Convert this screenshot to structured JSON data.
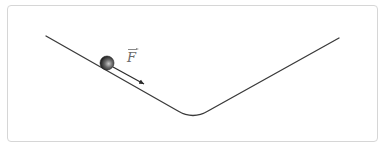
{
  "diagram": {
    "title": "",
    "force_label": "F",
    "force_is_vector": true,
    "colors": {
      "border": "#d6d6d6",
      "track": "#3a3a3a",
      "ball_dark": "#1e1e1e",
      "ball_light": "#bdbdbd",
      "arrow": "#2a2a2a",
      "label": "#6a6a6a"
    },
    "elements": [
      {
        "type": "track",
        "shape": "V-shaped incline with rounded bottom"
      },
      {
        "type": "ball",
        "position": "on left slope"
      },
      {
        "type": "force-arrow",
        "direction": "down the left slope",
        "label": "F"
      }
    ]
  }
}
